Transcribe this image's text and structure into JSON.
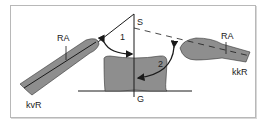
{
  "diagram": {
    "labels": {
      "S": "S",
      "G": "G",
      "angle1": "1",
      "angle2": "2",
      "ra_left": "RA",
      "ra_right": "RA",
      "kvR": "kvR",
      "kkR": "kkR"
    },
    "colors": {
      "shape_fill": "#8e8e8e",
      "stroke": "#1a1a1a",
      "frame": "#b8b8b8"
    }
  }
}
